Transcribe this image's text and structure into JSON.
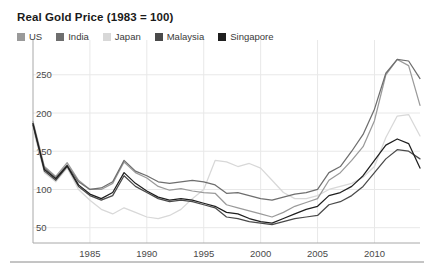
{
  "chart_data": {
    "type": "line",
    "title": "Real Gold Price (1983 = 100)",
    "xlabel": "",
    "ylabel": "",
    "xlim": [
      1980,
      2014
    ],
    "ylim": [
      30,
      285
    ],
    "grid": true,
    "legend_position": "top-left",
    "x_ticks": [
      "1985",
      "1990",
      "1995",
      "2000",
      "2005",
      "2010"
    ],
    "x_tick_values": [
      1985,
      1990,
      1995,
      2000,
      2005,
      2010
    ],
    "y_ticks": [
      "50",
      "100",
      "150",
      "200",
      "250"
    ],
    "y_tick_values": [
      50,
      100,
      150,
      200,
      250
    ],
    "x": [
      1980,
      1981,
      1982,
      1983,
      1984,
      1985,
      1986,
      1987,
      1988,
      1989,
      1990,
      1991,
      1992,
      1993,
      1994,
      1995,
      1996,
      1997,
      1998,
      1999,
      2000,
      2001,
      2002,
      2003,
      2004,
      2005,
      2006,
      2007,
      2008,
      2009,
      2010,
      2011,
      2012,
      2013,
      2014
    ],
    "series": [
      {
        "name": "US",
        "color": "#9a9a9a",
        "values": [
          189,
          130,
          117,
          135,
          112,
          100,
          100,
          108,
          136,
          122,
          115,
          104,
          99,
          101,
          98,
          96,
          95,
          80,
          76,
          72,
          68,
          64,
          70,
          78,
          83,
          88,
          112,
          122,
          138,
          156,
          190,
          250,
          270,
          262,
          210
        ]
      },
      {
        "name": "India",
        "color": "#6e6e6e",
        "values": [
          186,
          128,
          115,
          132,
          110,
          100,
          102,
          110,
          138,
          124,
          118,
          110,
          108,
          110,
          112,
          110,
          106,
          95,
          96,
          92,
          88,
          86,
          90,
          94,
          96,
          100,
          122,
          130,
          150,
          172,
          205,
          252,
          270,
          268,
          245
        ]
      },
      {
        "name": "Japan",
        "color": "#d8d8d8",
        "values": [
          180,
          122,
          110,
          128,
          100,
          86,
          74,
          68,
          76,
          70,
          64,
          62,
          66,
          74,
          88,
          100,
          138,
          136,
          130,
          134,
          128,
          112,
          96,
          88,
          88,
          92,
          100,
          104,
          108,
          116,
          130,
          168,
          196,
          198,
          170
        ]
      },
      {
        "name": "Malaysia",
        "color": "#4a4a4a",
        "values": [
          184,
          124,
          112,
          130,
          104,
          92,
          86,
          92,
          118,
          104,
          96,
          88,
          84,
          86,
          84,
          80,
          76,
          64,
          62,
          58,
          56,
          54,
          58,
          62,
          64,
          66,
          80,
          84,
          92,
          104,
          122,
          140,
          152,
          150,
          140
        ]
      },
      {
        "name": "Singapore",
        "color": "#1f1f1f",
        "values": [
          186,
          126,
          114,
          131,
          106,
          94,
          88,
          96,
          122,
          108,
          98,
          90,
          86,
          88,
          86,
          82,
          78,
          70,
          68,
          62,
          58,
          56,
          62,
          68,
          74,
          78,
          92,
          96,
          104,
          118,
          138,
          158,
          166,
          160,
          128
        ]
      }
    ]
  },
  "legend": {
    "items": [
      {
        "label": "US"
      },
      {
        "label": "India"
      },
      {
        "label": "Japan"
      },
      {
        "label": "Malaysia"
      },
      {
        "label": "Singapore"
      }
    ]
  }
}
